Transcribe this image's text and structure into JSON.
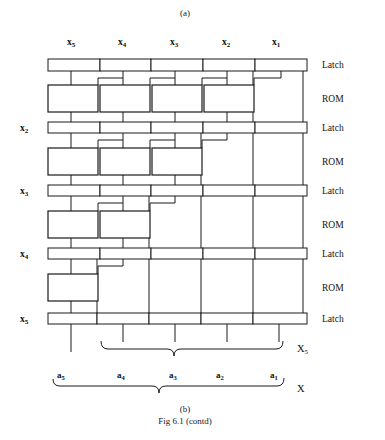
{
  "figure": {
    "panel_top_label": "(a)",
    "panel_bottom_label": "(b)",
    "caption": "Fig 6.1 (contd)"
  },
  "column_headers": [
    {
      "name": "x5",
      "base": "x",
      "sub": "5"
    },
    {
      "name": "x4",
      "base": "x",
      "sub": "4"
    },
    {
      "name": "x3",
      "base": "x",
      "sub": "3"
    },
    {
      "name": "x2",
      "base": "x",
      "sub": "2"
    },
    {
      "name": "x1",
      "base": "x",
      "sub": "1"
    }
  ],
  "row_labels_left": [
    {
      "name": "x2",
      "base": "x",
      "sub": "2"
    },
    {
      "name": "x3",
      "base": "x",
      "sub": "3"
    },
    {
      "name": "x4",
      "base": "x",
      "sub": "4"
    },
    {
      "name": "x5",
      "base": "x",
      "sub": "5"
    }
  ],
  "stage_labels_right": [
    "Latch",
    "ROM",
    "Latch",
    "ROM",
    "Latch",
    "ROM",
    "Latch",
    "ROM",
    "Latch"
  ],
  "latch_rows": [
    {
      "id": "latch-1",
      "cells": 5,
      "hatched_index": 4,
      "left_label": ""
    },
    {
      "id": "latch-2",
      "cells": 5,
      "hatched_index": 3,
      "left_label": "x2"
    },
    {
      "id": "latch-3",
      "cells": 5,
      "hatched_index": 2,
      "left_label": "x3"
    },
    {
      "id": "latch-4",
      "cells": 5,
      "hatched_index": 1,
      "left_label": "x4"
    },
    {
      "id": "latch-5",
      "cells": 5,
      "hatched_index": 0,
      "left_label": "x5"
    }
  ],
  "rom_rows": [
    {
      "id": "rom-1",
      "box_count": 4
    },
    {
      "id": "rom-2",
      "box_count": 3
    },
    {
      "id": "rom-3",
      "box_count": 2
    },
    {
      "id": "rom-4",
      "box_count": 1
    }
  ],
  "brace_labels": {
    "upper": {
      "base": "X",
      "sub": "5"
    },
    "lower": {
      "base": "X",
      "sub": ""
    }
  },
  "bit_labels": [
    {
      "base": "a",
      "sub": "5"
    },
    {
      "base": "a",
      "sub": "4"
    },
    {
      "base": "a",
      "sub": "3"
    },
    {
      "base": "a",
      "sub": "2"
    },
    {
      "base": "a",
      "sub": "1"
    }
  ],
  "colors": {
    "ink": "#1a1a1a",
    "paper": "#ffffff",
    "hatch": "#2b2b2b"
  }
}
